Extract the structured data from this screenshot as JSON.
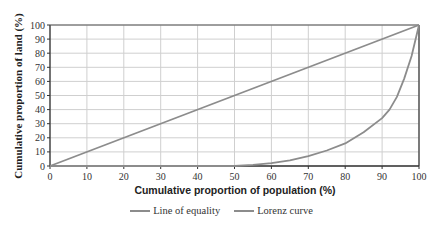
{
  "chart_data": {
    "type": "line",
    "title": "",
    "xlabel": "Cumulative proportion of population (%)",
    "ylabel": "Cumulative proportion of land (%)",
    "xlim": [
      0,
      100
    ],
    "ylim": [
      0,
      100
    ],
    "x_ticks": [
      0,
      10,
      20,
      30,
      40,
      50,
      60,
      70,
      80,
      90,
      100
    ],
    "y_ticks": [
      0,
      10,
      20,
      30,
      40,
      50,
      60,
      70,
      80,
      90,
      100
    ],
    "grid": true,
    "legend_position": "bottom",
    "series": [
      {
        "name": "Line of equality",
        "color": "#8c8c8c",
        "x": [
          0,
          100
        ],
        "y": [
          0,
          100
        ]
      },
      {
        "name": "Lorenz curve",
        "color": "#8c8c8c",
        "x": [
          0,
          10,
          20,
          30,
          40,
          50,
          55,
          60,
          65,
          70,
          75,
          80,
          85,
          90,
          92,
          94,
          96,
          98,
          100
        ],
        "y": [
          0,
          0,
          0,
          0,
          0,
          0,
          0.8,
          2,
          4,
          7,
          11,
          16,
          24,
          34,
          40,
          49,
          62,
          78,
          100
        ]
      }
    ]
  },
  "legend": {
    "items": [
      {
        "label": "Line of equality",
        "color": "#8c8c8c"
      },
      {
        "label": "Lorenz curve",
        "color": "#8c8c8c"
      }
    ]
  }
}
